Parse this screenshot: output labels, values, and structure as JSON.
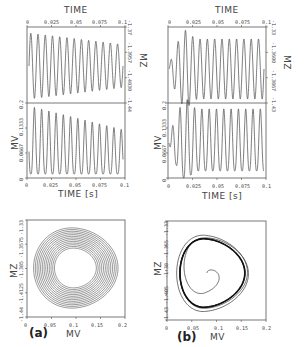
{
  "figure": {
    "panels": [
      {
        "id": "a",
        "label": "(a)",
        "time_series": {
          "top_axis_title": "TIME",
          "top_ticks": [
            "0",
            "0.025",
            "0.05",
            "0.075",
            "0.1"
          ],
          "mz_label": "MZ",
          "mz_ticks": [
            "-1.37",
            "-1.3957",
            "-1.4030",
            "-1.44"
          ],
          "mv_label": "MV",
          "mv_ticks": [
            "0.2",
            "0.1333",
            "0.0667",
            "0"
          ],
          "bottom_ticks": [
            "0",
            "0.025",
            "0.05",
            "0.075",
            "0.1"
          ],
          "bottom_axis_title": "TIME [s]"
        },
        "phase_plot": {
          "ylabel": "MZ",
          "yticks": [
            "-1.33",
            "-1.3575",
            "-1.385",
            "-1.4125",
            "-1.44"
          ],
          "xlabel": "MV",
          "xticks": [
            "0",
            "0.05",
            "0.1",
            "0.15",
            "0.2"
          ]
        }
      },
      {
        "id": "b",
        "label": "(b)",
        "time_series": {
          "top_axis_title": "TIME",
          "top_ticks": [
            "0",
            "0.025",
            "0.05",
            "0.075",
            "0.1"
          ],
          "mz_label": "MZ",
          "mz_ticks": [
            "-1.33",
            "-1.3600",
            "-1.3867",
            "-1.43"
          ],
          "mv_label": "MV",
          "mv_ticks": [
            "0.2",
            "0.1333",
            "0.0667",
            "0"
          ],
          "bottom_ticks": [
            "0",
            "0.025",
            "0.05",
            "0.075",
            "0.1"
          ],
          "bottom_axis_title": "TIME [s]"
        },
        "phase_plot": {
          "ylabel": "MZ",
          "yticks": [
            "-1.33",
            "-1.355",
            "-1.38",
            "-1.405",
            "-1.43"
          ],
          "xlabel": "MV",
          "xticks": [
            "0",
            "0.05",
            "0.1",
            "0.15",
            "0.2"
          ]
        }
      }
    ]
  },
  "chart_data": [
    {
      "type": "line",
      "title": "(a) MZ vs TIME",
      "xlabel": "TIME [s]",
      "ylabel": "MZ",
      "xlim": [
        0,
        0.1
      ],
      "ylim": [
        -1.44,
        -1.37
      ],
      "description": "damped oscillation, ~13 cycles, amplitude decreasing over time",
      "series": [
        {
          "name": "MZ",
          "cycles": 13,
          "damped": true
        }
      ]
    },
    {
      "type": "line",
      "title": "(a) MV vs TIME",
      "xlabel": "TIME [s]",
      "ylabel": "MV",
      "xlim": [
        0,
        0.1
      ],
      "ylim": [
        0,
        0.2
      ],
      "series": [
        {
          "name": "MV",
          "cycles": 13,
          "peak_start": 0.2,
          "peak_end": 0.12,
          "min": 0.01
        }
      ]
    },
    {
      "type": "line",
      "title": "(a) MZ vs MV phase plot",
      "xlabel": "MV",
      "ylabel": "MZ",
      "xlim": [
        0,
        0.2
      ],
      "ylim": [
        -1.44,
        -1.33
      ],
      "description": "inward spiral of ~13 nested loops"
    },
    {
      "type": "line",
      "title": "(b) MZ vs TIME",
      "xlabel": "TIME [s]",
      "ylabel": "MZ",
      "xlim": [
        0,
        0.1
      ],
      "ylim": [
        -1.43,
        -1.33
      ],
      "description": "transient growth then sustained oscillation, ~13 cycles"
    },
    {
      "type": "line",
      "title": "(b) MV vs TIME",
      "xlabel": "TIME [s]",
      "ylabel": "MV",
      "xlim": [
        0,
        0.1
      ],
      "ylim": [
        0,
        0.2
      ],
      "series": [
        {
          "name": "MV",
          "cycles": 13,
          "start": 0.06,
          "first_peak": 0.2,
          "steady_peak": 0.15
        }
      ]
    },
    {
      "type": "line",
      "title": "(b) MZ vs MV phase plot",
      "xlabel": "MV",
      "ylabel": "MZ",
      "xlim": [
        0,
        0.2
      ],
      "ylim": [
        -1.43,
        -1.33
      ],
      "description": "outward spiral from center (0.08,-1.38) converging to a limit cycle"
    }
  ]
}
